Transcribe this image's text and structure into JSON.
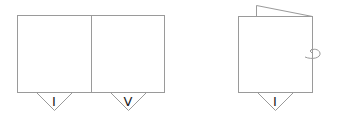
{
  "diagram": {
    "open_card": {
      "panels": [
        {
          "marker_label": "I"
        },
        {
          "marker_label": "V"
        }
      ]
    },
    "folded_card": {
      "marker_label": "I",
      "action_icon": "rotate-arrow-icon"
    },
    "colors": {
      "line": "#9a9a9a",
      "marker_text": "#222222"
    }
  }
}
